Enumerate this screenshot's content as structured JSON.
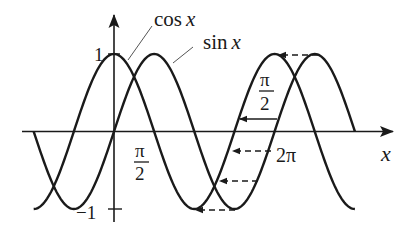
{
  "figure": {
    "background": "#ffffff",
    "ink": "#1a1a1a",
    "geometry": {
      "origin_x": 114,
      "origin_y": 131.5,
      "px_per_pi": 80.3,
      "amplitude_px": 77.5,
      "x_axis_from": 22,
      "x_axis_to": 393,
      "y_axis_from": 222,
      "y_axis_to": 15
    },
    "curves": [
      {
        "name": "cos",
        "label": "cos x",
        "func": "cos",
        "from_pi": -1,
        "to_pi": 3
      },
      {
        "name": "sin",
        "label": "sin x",
        "func": "sin",
        "from_pi": -1,
        "to_pi": 3
      }
    ],
    "labels": {
      "cos_name": "cos",
      "sin_name": "sin",
      "var": "x",
      "y_one": "1",
      "y_minus_one": "−1",
      "pi": "π",
      "two": "2",
      "two_pi": "2π",
      "x_axis": "x"
    },
    "shift_arrows": [
      {
        "y": 55,
        "x_from": 318,
        "x_to": 279,
        "style": "dashed"
      },
      {
        "y": 119,
        "x_from": 277,
        "x_to": 240,
        "style": "solid"
      },
      {
        "y": 151,
        "x_from": 271,
        "x_to": 233,
        "style": "dashed"
      },
      {
        "y": 181,
        "x_from": 258,
        "x_to": 220,
        "style": "dashed"
      },
      {
        "y": 210,
        "x_from": 235,
        "x_to": 196,
        "style": "dashed"
      }
    ],
    "tick_labels": [
      {
        "text": "π/2",
        "position": "x = π/2 below axis"
      },
      {
        "text": "2π",
        "position": "x = 2π below axis"
      },
      {
        "text": "1",
        "position": "y = 1"
      },
      {
        "text": "−1",
        "position": "y = −1"
      },
      {
        "text": "π/2",
        "position": "horizontal shift annotation"
      }
    ]
  }
}
